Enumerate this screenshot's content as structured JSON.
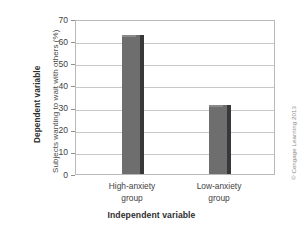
{
  "chart_data": {
    "type": "bar",
    "title": "",
    "categories": [
      "High-anxiety group",
      "Low-anxiety group"
    ],
    "category_lines": [
      [
        "High-anxiety",
        "group"
      ],
      [
        "Low-anxiety",
        "group"
      ]
    ],
    "values": [
      63,
      31
    ],
    "xlabel": "Independent variable",
    "ylabel": "Subjects wanting to wait with others (%)",
    "y_axis_group_label": "Dependent variable",
    "ylim": [
      0,
      70
    ],
    "ytick_step": 10,
    "yticks": [
      0,
      10,
      20,
      30,
      40,
      50,
      60,
      70
    ],
    "ytick_labels": [
      "0",
      "10",
      "20",
      "30",
      "40",
      "50",
      "60",
      "70"
    ],
    "grid": "horizontal",
    "legend": "none",
    "bar_color": "#6e6e6e",
    "bar_edge_color": "#38383a",
    "grid_color": "#c9c9c9",
    "frame_color": "#b9b9b9"
  },
  "annotations": {
    "copyright": "© Cengage Learning 2013"
  }
}
